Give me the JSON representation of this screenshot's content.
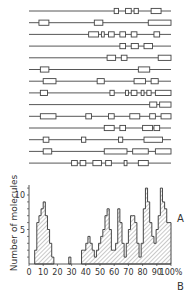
{
  "panel_a": {
    "label": "A",
    "x_range": [
      0,
      100
    ],
    "molecules": [
      {
        "segments": [
          [
            60,
            63
          ],
          [
            68,
            72
          ],
          [
            74,
            77
          ],
          [
            86,
            93
          ]
        ]
      },
      {
        "segments": [
          [
            7,
            14
          ],
          [
            46,
            52
          ],
          [
            84,
            100
          ]
        ]
      },
      {
        "segments": [
          [
            42,
            49
          ],
          [
            51,
            53
          ],
          [
            56,
            60
          ],
          [
            64,
            68
          ],
          [
            72,
            76
          ],
          [
            88,
            92
          ]
        ]
      },
      {
        "segments": [
          [
            64,
            68
          ],
          [
            72,
            77
          ],
          [
            81,
            87
          ]
        ]
      },
      {
        "segments": [
          [
            55,
            61
          ],
          [
            65,
            69
          ],
          [
            91,
            100
          ]
        ]
      },
      {
        "segments": [
          [
            8,
            14
          ],
          [
            77,
            85
          ]
        ]
      },
      {
        "segments": [
          [
            10,
            19
          ],
          [
            48,
            53
          ],
          [
            74,
            82
          ],
          [
            86,
            91
          ]
        ]
      },
      {
        "segments": [
          [
            8,
            13
          ],
          [
            57,
            60
          ],
          [
            68,
            70
          ],
          [
            72,
            76
          ],
          [
            79,
            81
          ],
          [
            83,
            86
          ],
          [
            89,
            100
          ]
        ]
      },
      {
        "segments": [
          [
            85,
            90
          ],
          [
            92,
            100
          ]
        ]
      },
      {
        "segments": [
          [
            8,
            19
          ],
          [
            40,
            44
          ],
          [
            56,
            60
          ],
          [
            71,
            78
          ],
          [
            85,
            89
          ],
          [
            93,
            100
          ]
        ]
      },
      {
        "segments": [
          [
            53,
            60
          ],
          [
            64,
            68
          ],
          [
            80,
            87
          ],
          [
            88,
            92
          ]
        ]
      },
      {
        "segments": [
          [
            10,
            14
          ],
          [
            37,
            40
          ],
          [
            63,
            66
          ],
          [
            81,
            94
          ]
        ]
      },
      {
        "segments": [
          [
            10,
            16
          ],
          [
            53,
            69
          ],
          [
            73,
            84
          ],
          [
            89,
            100
          ]
        ]
      },
      {
        "segments": [
          [
            30,
            34
          ],
          [
            36,
            40
          ],
          [
            45,
            51
          ],
          [
            54,
            58
          ],
          [
            67,
            69
          ],
          [
            77,
            84
          ]
        ]
      }
    ]
  },
  "chart_data": {
    "type": "bar",
    "title": "",
    "panel_label": "B",
    "xlabel": "",
    "ylabel": "Number of molecules",
    "xlim": [
      0,
      100
    ],
    "ylim": [
      0,
      12
    ],
    "x_ticks": [
      "0",
      "10",
      "20",
      "30",
      "40",
      "50",
      "60",
      "70",
      "80",
      "90",
      "100%"
    ],
    "y_ticks": [
      "5",
      "10"
    ],
    "bin_width": 1.5,
    "x": [
      4,
      5.5,
      7,
      8.5,
      10,
      11.5,
      13,
      14.5,
      16,
      28,
      37,
      38.5,
      40,
      41.5,
      43,
      44.5,
      46,
      47.5,
      49,
      50.5,
      52,
      53.5,
      55,
      56.5,
      58,
      59.5,
      61,
      62.5,
      64,
      65.5,
      67,
      68.5,
      70,
      71.5,
      73,
      74.5,
      76,
      77.5,
      79,
      80.5,
      82,
      83.5,
      85,
      86.5,
      88,
      89.5,
      91,
      92.5,
      94,
      95.5,
      97,
      98.5
    ],
    "values": [
      2,
      6,
      7,
      8,
      9,
      7,
      5,
      3,
      1,
      1,
      2,
      2,
      3,
      4,
      3,
      2,
      1,
      2,
      3,
      4,
      5,
      7,
      8,
      5,
      2,
      2,
      3,
      8,
      6,
      3,
      1,
      3,
      5,
      7,
      7,
      6,
      3,
      1,
      3,
      8,
      11,
      9,
      6,
      4,
      3,
      5,
      7,
      11,
      9,
      8,
      6,
      6
    ],
    "grid": false,
    "legend": null
  }
}
